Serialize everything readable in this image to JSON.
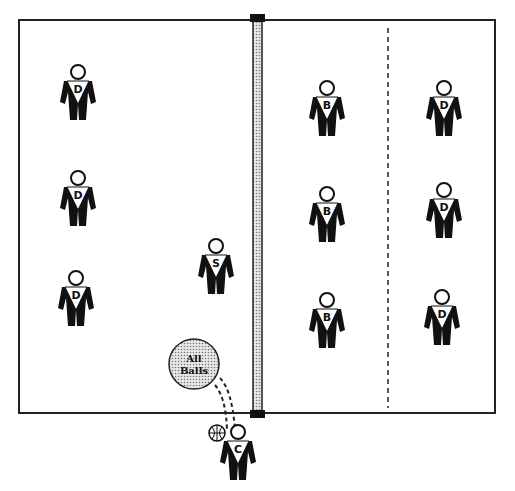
{
  "court": {
    "outline_color": "#222222",
    "net_fill": "#bdbdbd",
    "center_dashed_line": true
  },
  "players": [
    {
      "id": "p1",
      "letter": "D",
      "x": 78,
      "y": 90
    },
    {
      "id": "p2",
      "letter": "D",
      "x": 78,
      "y": 196
    },
    {
      "id": "p3",
      "letter": "D",
      "x": 76,
      "y": 296
    },
    {
      "id": "p4",
      "letter": "S",
      "x": 216,
      "y": 264
    },
    {
      "id": "p5",
      "letter": "B",
      "x": 327,
      "y": 106
    },
    {
      "id": "p6",
      "letter": "B",
      "x": 327,
      "y": 212
    },
    {
      "id": "p7",
      "letter": "B",
      "x": 327,
      "y": 318
    },
    {
      "id": "p8",
      "letter": "D",
      "x": 444,
      "y": 106
    },
    {
      "id": "p9",
      "letter": "D",
      "x": 444,
      "y": 208
    },
    {
      "id": "p10",
      "letter": "D",
      "x": 442,
      "y": 315
    },
    {
      "id": "coach",
      "letter": "C",
      "x": 238,
      "y": 450
    }
  ],
  "ball_cart": {
    "line1": "All",
    "line2": "Balls",
    "fill": "#c8c8c8"
  },
  "ball_icon": "volleyball-icon"
}
